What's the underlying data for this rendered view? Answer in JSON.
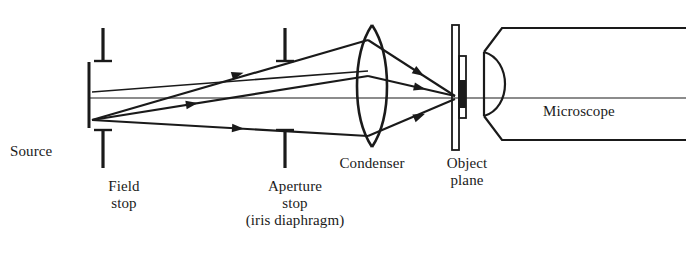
{
  "figure": {
    "background_color": "#ffffff",
    "ink_color": "#1a1a1a",
    "width": 686,
    "height": 279
  },
  "labels": {
    "source": "Source",
    "field_stop": "Field\nstop",
    "aperture_stop": "Aperture\nstop\n(iris diaphragm)",
    "condenser": "Condenser",
    "object_plane": "Object\nplane",
    "microscope": "Microscope"
  },
  "components": [
    {
      "name": "source",
      "label": "Source",
      "type": "vertical-bar",
      "x": 88,
      "y_top": 62,
      "y_bottom": 128
    },
    {
      "name": "field-stop",
      "label": "Field stop",
      "type": "aperture-stop-pair",
      "x": 103,
      "upper_blade_top": 28,
      "upper_blade_bottom": 63,
      "lower_blade_top": 128,
      "lower_blade_bottom": 168
    },
    {
      "name": "aperture-stop",
      "label": "Aperture stop (iris diaphragm)",
      "type": "aperture-stop-pair",
      "x": 285,
      "upper_blade_top": 28,
      "upper_blade_bottom": 63,
      "lower_blade_top": 128,
      "lower_blade_bottom": 168
    },
    {
      "name": "condenser",
      "label": "Condenser",
      "type": "biconvex-lens",
      "x": 372,
      "y_top": 25,
      "y_bottom": 147,
      "half_width": 26
    },
    {
      "name": "object-plane",
      "label": "Object plane",
      "type": "specimen-slide",
      "x": 455,
      "y_top": 25,
      "y_bottom": 150
    },
    {
      "name": "microscope",
      "label": "Microscope",
      "type": "tapered-tube-with-objective",
      "x_front": 484,
      "x_back": 686,
      "y_top": 28,
      "y_bottom": 140
    }
  ],
  "optical_axis": {
    "name": "optical-axis",
    "y": 98,
    "x_start": 88,
    "x_end": 686
  },
  "rays": [
    {
      "name": "upper-ray",
      "from": "source",
      "to": "object-plane",
      "points": [
        [
          92,
          120
        ],
        [
          368,
          40
        ],
        [
          455,
          97
        ]
      ],
      "arrow_positions": [
        [
          240,
          73
        ],
        [
          420,
          63
        ]
      ]
    },
    {
      "name": "axial-ray",
      "from": "source",
      "to": "object-plane",
      "points": [
        [
          92,
          120
        ],
        [
          368,
          76
        ],
        [
          455,
          97
        ]
      ],
      "arrow_positions": [
        [
          192,
          106
        ],
        [
          418,
          84
        ]
      ]
    },
    {
      "name": "lower-ray",
      "from": "source",
      "to": "object-plane",
      "points": [
        [
          92,
          120
        ],
        [
          368,
          136
        ],
        [
          455,
          97
        ]
      ],
      "arrow_positions": [
        [
          240,
          119
        ],
        [
          420,
          124
        ]
      ]
    },
    {
      "name": "field-edge-ray",
      "from": "source-top",
      "to": "condenser",
      "points": [
        [
          92,
          92
        ],
        [
          368,
          72
        ]
      ],
      "arrow_positions": []
    }
  ]
}
